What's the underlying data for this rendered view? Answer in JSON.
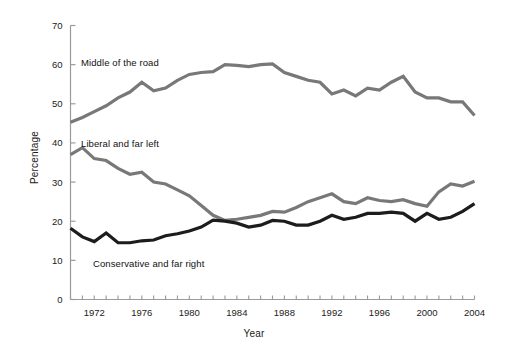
{
  "chart_data": {
    "type": "line",
    "title": "",
    "xlabel": "Year",
    "ylabel": "Percentage",
    "xlim": [
      1970,
      2004
    ],
    "ylim": [
      0,
      70
    ],
    "grid": false,
    "legend_position": "inline-annotations",
    "x": [
      1970,
      1971,
      1972,
      1973,
      1974,
      1975,
      1976,
      1977,
      1978,
      1979,
      1980,
      1981,
      1982,
      1983,
      1984,
      1985,
      1986,
      1987,
      1988,
      1989,
      1990,
      1991,
      1992,
      1993,
      1994,
      1995,
      1996,
      1997,
      1998,
      1999,
      2000,
      2001,
      2002,
      2003,
      2004
    ],
    "x_tick_labels": [
      "1972",
      "1976",
      "1980",
      "1984",
      "1988",
      "1992",
      "1996",
      "2000",
      "2004"
    ],
    "x_tick_values": [
      1972,
      1976,
      1980,
      1984,
      1988,
      1992,
      1996,
      2000,
      2004
    ],
    "y_tick_labels": [
      "0",
      "10",
      "20",
      "30",
      "40",
      "50",
      "60",
      "70"
    ],
    "y_tick_values": [
      0,
      10,
      20,
      30,
      40,
      50,
      60,
      70
    ],
    "series": [
      {
        "name": "Middle of the road",
        "color": "#787878",
        "label_text": "Middle of the road",
        "values": [
          45.3,
          46.5,
          48.0,
          49.5,
          51.5,
          53.0,
          55.5,
          53.3,
          54.0,
          56.0,
          57.5,
          58.0,
          58.2,
          60.0,
          59.8,
          59.5,
          60.0,
          60.2,
          58.0,
          57.0,
          56.0,
          55.5,
          52.5,
          53.5,
          52.0,
          54.0,
          53.5,
          55.5,
          57.0,
          53.0,
          51.5,
          51.5,
          50.5,
          50.5,
          47.0
        ]
      },
      {
        "name": "Liberal and far left",
        "color": "#787878",
        "label_text": "Liberal and far left",
        "values": [
          37.0,
          38.8,
          36.0,
          35.5,
          33.5,
          32.0,
          32.5,
          30.0,
          29.5,
          28.0,
          26.5,
          24.0,
          21.5,
          20.2,
          20.5,
          21.0,
          21.5,
          22.5,
          22.3,
          23.5,
          25.0,
          26.0,
          27.0,
          25.0,
          24.5,
          26.0,
          25.3,
          25.0,
          25.5,
          24.5,
          23.8,
          27.5,
          29.5,
          29.0,
          30.2
        ]
      },
      {
        "name": "Conservative and far right",
        "color": "#1c1c1c",
        "label_text": "Conservative and far right",
        "values": [
          18.2,
          16.0,
          14.8,
          17.0,
          14.5,
          14.5,
          15.0,
          15.2,
          16.3,
          16.8,
          17.5,
          18.5,
          20.3,
          20.0,
          19.5,
          18.5,
          19.0,
          20.2,
          20.0,
          19.0,
          19.0,
          20.0,
          21.5,
          20.5,
          21.0,
          22.0,
          22.0,
          22.3,
          22.0,
          20.0,
          22.0,
          20.5,
          21.0,
          22.5,
          24.5
        ]
      }
    ]
  },
  "axis": {
    "ylabel": "Percentage",
    "xlabel": "Year"
  }
}
